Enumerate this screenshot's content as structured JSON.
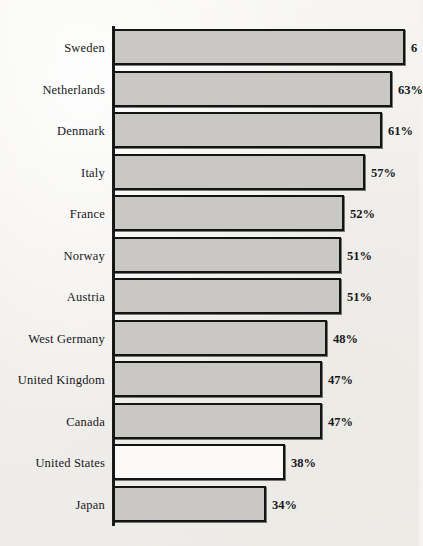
{
  "chart_data": {
    "type": "bar",
    "orientation": "horizontal",
    "title": "",
    "subtitle": "",
    "xlabel": "",
    "ylabel": "",
    "grid": false,
    "legend": null,
    "xlim": [
      0,
      70
    ],
    "value_suffix": "%",
    "categories": [
      "Sweden",
      "Netherlands",
      "Denmark",
      "Italy",
      "France",
      "Norway",
      "Austria",
      "West Germany",
      "United Kingdom",
      "Canada",
      "United States",
      "Japan"
    ],
    "values": [
      66,
      63,
      61,
      57,
      52,
      51,
      51,
      48,
      47,
      47,
      38,
      34
    ],
    "data_labels": [
      "6",
      "63%",
      "61%",
      "57%",
      "52%",
      "51%",
      "51%",
      "48%",
      "47%",
      "47%",
      "38%",
      "34%"
    ],
    "label_notes": "Top bar's data label is clipped by the right edge of the image; only '6' is visible.",
    "highlighted_category": "United States",
    "colors": {
      "bar_fill": "#c9c8c5",
      "bar_fill_highlight": "#fbfaf8",
      "bar_stroke": "#141414",
      "axis": "#1b1b1b",
      "text": "#17171a",
      "background": "#f4f3f0"
    }
  },
  "bars": [
    {
      "label": "Sweden",
      "value_label": "6",
      "bar_width": 292,
      "hollow": false
    },
    {
      "label": "Netherlands",
      "value_label": "63%",
      "bar_width": 279,
      "hollow": false
    },
    {
      "label": "Denmark",
      "value_label": "61%",
      "bar_width": 269,
      "hollow": false
    },
    {
      "label": "Italy",
      "value_label": "57%",
      "bar_width": 252,
      "hollow": false
    },
    {
      "label": "France",
      "value_label": "52%",
      "bar_width": 231,
      "hollow": false
    },
    {
      "label": "Norway",
      "value_label": "51%",
      "bar_width": 228,
      "hollow": false
    },
    {
      "label": "Austria",
      "value_label": "51%",
      "bar_width": 228,
      "hollow": false
    },
    {
      "label": "West Germany",
      "value_label": "48%",
      "bar_width": 214,
      "hollow": false
    },
    {
      "label": "United Kingdom",
      "value_label": "47%",
      "bar_width": 209,
      "hollow": false
    },
    {
      "label": "Canada",
      "value_label": "47%",
      "bar_width": 209,
      "hollow": false
    },
    {
      "label": "United States",
      "value_label": "38%",
      "bar_width": 172,
      "hollow": true
    },
    {
      "label": "Japan",
      "value_label": "34%",
      "bar_width": 153,
      "hollow": false
    }
  ]
}
